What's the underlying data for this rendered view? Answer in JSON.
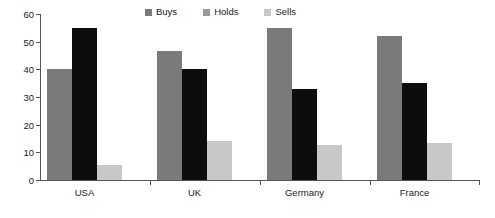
{
  "chart_data": {
    "type": "bar",
    "title": "",
    "subtitle": "",
    "xlabel": "",
    "ylabel": "",
    "categories": [
      "USA",
      "UK",
      "Germany",
      "France"
    ],
    "series": [
      {
        "name": "Buys",
        "color": "#7a7a7a",
        "values": [
          40,
          46.5,
          55,
          52
        ]
      },
      {
        "name": "Holds",
        "color": "#0d0d0d",
        "values": [
          55,
          40,
          33,
          35
        ]
      },
      {
        "name": "Sells",
        "color": "#c8c8c8",
        "values": [
          5.5,
          14,
          12.5,
          13.5
        ]
      }
    ],
    "ylim": [
      0,
      60
    ],
    "yticks": [
      0,
      10,
      20,
      30,
      40,
      50,
      60
    ],
    "ytick_labels": [
      "0",
      "10",
      "20",
      "30",
      "40",
      "50",
      "60"
    ],
    "grid": false,
    "legend_position": "top-center",
    "orientation": "vertical",
    "grouping": "grouped"
  },
  "legend": {
    "items": [
      {
        "label": "Buys",
        "swatch_color": "#7a7a7a"
      },
      {
        "label": "Holds",
        "swatch_color": "#9a9a9a"
      },
      {
        "label": "Sells",
        "swatch_color": "#c8c8c8"
      }
    ]
  },
  "axes": {
    "axis_color": "#555555"
  }
}
